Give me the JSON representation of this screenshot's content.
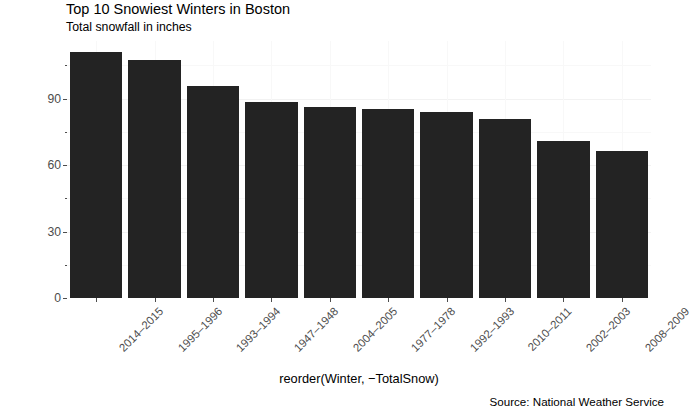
{
  "chart_data": {
    "type": "bar",
    "title": "Top 10 Snowiest Winters in Boston",
    "subtitle": "Total snowfall in inches",
    "caption": "Source: National Weather Service",
    "xlabel": "reorder(Winter, −TotalSnow)",
    "ylabel": "TotalSnow",
    "categories": [
      "2014–2015",
      "1995–1996",
      "1993–1994",
      "1947–1948",
      "2004–2005",
      "1977–1978",
      "1992–1993",
      "2010–2011",
      "2002–2003",
      "2008–2009"
    ],
    "values": [
      110.9,
      107.3,
      95.5,
      88.6,
      86.4,
      85.1,
      83.9,
      80.9,
      70.9,
      66.4
    ],
    "ylim": [
      0,
      116
    ],
    "yticks": [
      0,
      30,
      60,
      90
    ],
    "ytick_labels": [
      "0",
      "30",
      "60",
      "90"
    ],
    "y_minor_ticks": [
      15,
      45,
      75,
      105
    ],
    "grid": true,
    "legend": "none",
    "bar_color": "#232323",
    "panel_background": "#ffffff",
    "grid_color": "#f2f2f2",
    "axis_text_color": "#4d4d4d"
  }
}
